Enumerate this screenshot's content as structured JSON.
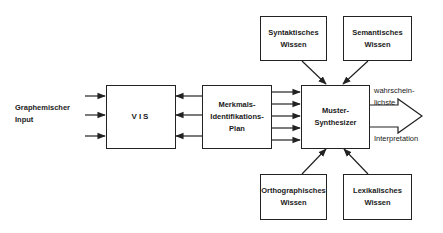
{
  "input_label": {
    "line1": "Graphemischer",
    "line2": "Input"
  },
  "boxes": {
    "vis": {
      "label": "VIS"
    },
    "merkmals": {
      "line1": "Merkmals-",
      "line2": "Identifikations-",
      "line3": "Plan"
    },
    "muster": {
      "line1": "Muster-",
      "line2": "Synthesizer"
    },
    "syntaktisch": {
      "line1": "Syntaktisches",
      "line2": "Wissen"
    },
    "semantisch": {
      "line1": "Semantisches",
      "line2": "Wissen"
    },
    "orthographisch": {
      "line1": "Orthographisches",
      "line2": "Wissen"
    },
    "lexikalisch": {
      "line1": "Lexikalisches",
      "line2": "Wissen"
    }
  },
  "output_label": {
    "line1": "wahrschein-",
    "line2": "lichste",
    "line3": "Interpretation"
  },
  "colors": {
    "stroke": "#222222",
    "background": "#ffffff"
  }
}
